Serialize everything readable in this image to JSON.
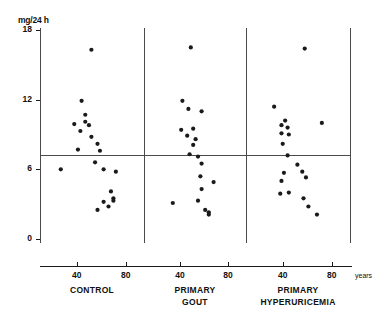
{
  "figure": {
    "yaxis_unit_label": "mg/24 h",
    "xaxis_unit_label": "years"
  },
  "chart_data": {
    "type": "scatter",
    "title": "",
    "xlabel": "years",
    "ylabel": "mg/24 h",
    "xlim": [
      10,
      95
    ],
    "ylim": [
      0,
      18
    ],
    "grid": false,
    "legend": "none",
    "yticks": [
      "0",
      "6",
      "12",
      "18"
    ],
    "ytick_values": [
      0,
      6,
      12,
      18
    ],
    "xticks": [
      "40",
      "80"
    ],
    "xtick_values": [
      40,
      80
    ],
    "reference_line_y": 7.2,
    "panels": [
      {
        "name": "control",
        "label": "CONTROL",
        "label_line1": "CONTROL",
        "label_line2": "",
        "points": [
          {
            "x": 52,
            "y": 16.3
          },
          {
            "x": 44,
            "y": 11.9
          },
          {
            "x": 47,
            "y": 10.7
          },
          {
            "x": 47,
            "y": 10.1
          },
          {
            "x": 38,
            "y": 9.9
          },
          {
            "x": 50,
            "y": 9.8
          },
          {
            "x": 43,
            "y": 9.3
          },
          {
            "x": 52,
            "y": 8.8
          },
          {
            "x": 57,
            "y": 8.2
          },
          {
            "x": 41,
            "y": 7.7
          },
          {
            "x": 59,
            "y": 7.6
          },
          {
            "x": 55,
            "y": 6.6
          },
          {
            "x": 27,
            "y": 6.0
          },
          {
            "x": 62,
            "y": 6.0
          },
          {
            "x": 72,
            "y": 5.8
          },
          {
            "x": 68,
            "y": 4.1
          },
          {
            "x": 70,
            "y": 3.5
          },
          {
            "x": 70,
            "y": 3.3
          },
          {
            "x": 62,
            "y": 3.2
          },
          {
            "x": 66,
            "y": 2.8
          },
          {
            "x": 57,
            "y": 2.5
          }
        ]
      },
      {
        "name": "primary-gout",
        "label": "PRIMARY GOUT",
        "label_line1": "PRIMARY",
        "label_line2": "GOUT",
        "points": [
          {
            "x": 49,
            "y": 16.5
          },
          {
            "x": 42,
            "y": 11.9
          },
          {
            "x": 47,
            "y": 11.2
          },
          {
            "x": 58,
            "y": 11.0
          },
          {
            "x": 41,
            "y": 9.4
          },
          {
            "x": 51,
            "y": 9.5
          },
          {
            "x": 46,
            "y": 8.9
          },
          {
            "x": 53,
            "y": 8.6
          },
          {
            "x": 51,
            "y": 8.1
          },
          {
            "x": 48,
            "y": 7.3
          },
          {
            "x": 55,
            "y": 7.1
          },
          {
            "x": 58,
            "y": 6.5
          },
          {
            "x": 57,
            "y": 5.4
          },
          {
            "x": 68,
            "y": 4.9
          },
          {
            "x": 58,
            "y": 4.3
          },
          {
            "x": 55,
            "y": 3.3
          },
          {
            "x": 34,
            "y": 3.1
          },
          {
            "x": 61,
            "y": 2.5
          },
          {
            "x": 64,
            "y": 2.3
          },
          {
            "x": 64,
            "y": 2.1
          }
        ]
      },
      {
        "name": "primary-hyperuricemia",
        "label": "PRIMARY HYPERURICEMIA",
        "label_line1": "PRIMARY",
        "label_line2": "HYPERURICEMIA",
        "points": [
          {
            "x": 58,
            "y": 16.4
          },
          {
            "x": 33,
            "y": 11.4
          },
          {
            "x": 42,
            "y": 10.2
          },
          {
            "x": 72,
            "y": 10.0
          },
          {
            "x": 39,
            "y": 9.8
          },
          {
            "x": 44,
            "y": 9.6
          },
          {
            "x": 39,
            "y": 9.1
          },
          {
            "x": 45,
            "y": 9.0
          },
          {
            "x": 40,
            "y": 8.2
          },
          {
            "x": 44,
            "y": 7.2
          },
          {
            "x": 52,
            "y": 6.4
          },
          {
            "x": 41,
            "y": 5.7
          },
          {
            "x": 56,
            "y": 5.8
          },
          {
            "x": 59,
            "y": 5.3
          },
          {
            "x": 39,
            "y": 5.0
          },
          {
            "x": 45,
            "y": 4.0
          },
          {
            "x": 38,
            "y": 3.9
          },
          {
            "x": 57,
            "y": 3.5
          },
          {
            "x": 61,
            "y": 2.8
          },
          {
            "x": 68,
            "y": 2.1
          }
        ]
      }
    ]
  }
}
